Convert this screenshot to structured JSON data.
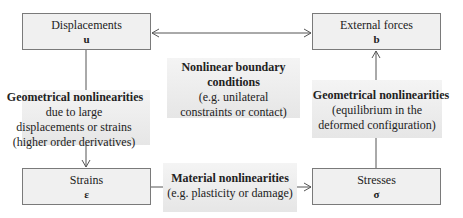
{
  "nodes": {
    "displacements": {
      "title": "Displacements",
      "symbol": "u"
    },
    "external_forces": {
      "title": "External forces",
      "symbol": "b"
    },
    "strains": {
      "title": "Strains",
      "symbol": "ε"
    },
    "stresses": {
      "title": "Stresses",
      "symbol": "σ"
    }
  },
  "labels": {
    "boundary": {
      "bold": "Nonlinear boundary conditions",
      "line1": "(e.g. unilateral",
      "line2": "constraints or contact)"
    },
    "geom_left": {
      "bold": "Geometrical nonlinearities",
      "line1": "due to large",
      "line2": "displacements or strains",
      "line3": "(higher order derivatives)"
    },
    "geom_right": {
      "bold": "Geometrical nonlinearities",
      "line1": "(equilibrium in the",
      "line2": "deformed configuration)"
    },
    "material": {
      "bold": "Material nonlinearities",
      "line1": "(e.g. plasticity or damage)"
    }
  },
  "colors": {
    "box_fill": "#f0f0f0",
    "border": "#7a7a7a",
    "line": "#555555"
  }
}
